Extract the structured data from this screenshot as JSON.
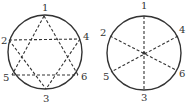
{
  "figures": [
    {
      "name": "hexagram-circle",
      "circle": {
        "cx": 45,
        "cy": 52,
        "r": 37
      },
      "points": [
        {
          "label": "1",
          "x": 44,
          "y": 16,
          "lx": 42,
          "ly": 11
        },
        {
          "label": "2",
          "x": 9,
          "y": 40,
          "lx": 1,
          "ly": 44
        },
        {
          "label": "4",
          "x": 80,
          "y": 39,
          "lx": 83,
          "ly": 40
        },
        {
          "label": "5",
          "x": 12,
          "y": 75,
          "lx": 3,
          "ly": 81
        },
        {
          "label": "6",
          "x": 78,
          "y": 75,
          "lx": 81,
          "ly": 80
        },
        {
          "label": "3",
          "x": 46,
          "y": 89,
          "lx": 43,
          "ly": 102
        }
      ],
      "segments": [
        [
          "1",
          "5"
        ],
        [
          "1",
          "6"
        ],
        [
          "5",
          "6"
        ],
        [
          "2",
          "4"
        ],
        [
          "2",
          "3"
        ],
        [
          "4",
          "3"
        ]
      ]
    },
    {
      "name": "diameters-circle",
      "circle": {
        "cx": 144,
        "cy": 53,
        "r": 37
      },
      "center_dot": true,
      "points": [
        {
          "label": "1",
          "x": 144,
          "y": 16,
          "lx": 141,
          "ly": 9
        },
        {
          "label": "2",
          "x": 110,
          "y": 36,
          "lx": 100,
          "ly": 36
        },
        {
          "label": "4",
          "x": 178,
          "y": 36,
          "lx": 179,
          "ly": 33
        },
        {
          "label": "5",
          "x": 111,
          "y": 72,
          "lx": 103,
          "ly": 80
        },
        {
          "label": "6",
          "x": 176,
          "y": 70,
          "lx": 179,
          "ly": 77
        },
        {
          "label": "3",
          "x": 144,
          "y": 90,
          "lx": 141,
          "ly": 101
        }
      ],
      "segments": [
        [
          "1",
          "3"
        ],
        [
          "2",
          "6"
        ],
        [
          "4",
          "5"
        ]
      ]
    }
  ],
  "colors": {
    "stroke": "#333333",
    "background": "#ffffff"
  }
}
